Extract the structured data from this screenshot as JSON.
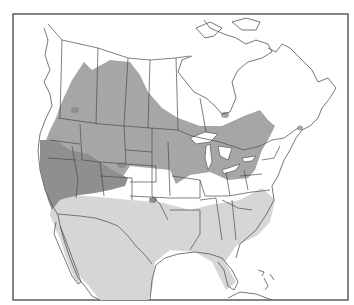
{
  "map": {
    "type": "species range map",
    "region": "North America",
    "legend_visible": false,
    "colors": {
      "summer": "#a6a6a6",
      "year_round": "#8f8f8f",
      "winter": "#d6d6d6",
      "land": "#ffffff",
      "outline": "#4a4a4a"
    },
    "ranges": [
      {
        "name": "breeding-summer",
        "color_key": "summer",
        "extent": "Western Canada prairies and boreal, northern US, Great Lakes, New England"
      },
      {
        "name": "year-round",
        "color_key": "year_round",
        "extent": "Pacific Northwest, Great Basin, California, central plains patches"
      },
      {
        "name": "winter",
        "color_key": "winter",
        "extent": "Southern US, Southeast, Florida, Mexico, Baja"
      }
    ]
  }
}
